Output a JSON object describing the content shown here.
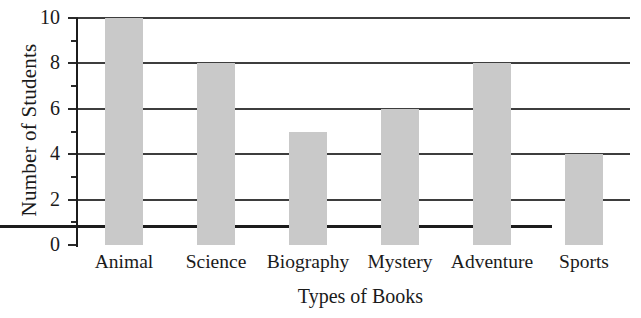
{
  "chart_data": {
    "type": "bar",
    "title": "",
    "subtitle": "",
    "xlabel": "Types of Books",
    "ylabel": "Number of Students",
    "categories": [
      "Animal",
      "Science",
      "Biography",
      "Mystery",
      "Adventure",
      "Sports"
    ],
    "values": [
      10,
      8,
      5,
      6,
      8,
      4
    ],
    "series": [
      {
        "name": "Number of Students",
        "values": [
          10,
          8,
          5,
          6,
          8,
          4
        ]
      }
    ],
    "ylim": [
      0,
      10
    ],
    "xlim": null,
    "y_major_ticks": [
      0,
      2,
      4,
      6,
      8,
      10
    ],
    "y_minor_ticks": [
      1,
      3,
      5,
      7,
      9
    ],
    "ytick_labels": [
      "0",
      "2",
      "4",
      "6",
      "8",
      "10"
    ],
    "grid": "horizontal-major-only",
    "legend": null,
    "legend_position": "none",
    "annotations": [],
    "bar_color": "#c9c9c9",
    "axis_color": "#1c1c1c",
    "gridline_color": "#3d3d3d",
    "background_color": "#ffffff",
    "text_color": "#1a1a1a"
  },
  "axes": {
    "y_title": "Number of Students",
    "x_title": "Types of Books"
  },
  "ytick_labels": [
    {
      "value": 10,
      "text": "10"
    },
    {
      "value": 8,
      "text": "8"
    },
    {
      "value": 6,
      "text": "6"
    },
    {
      "value": 4,
      "text": "4"
    },
    {
      "value": 2,
      "text": "2"
    },
    {
      "value": 0,
      "text": "0"
    }
  ],
  "bars": [
    {
      "label": "Animal",
      "value": 10
    },
    {
      "label": "Science",
      "value": 8
    },
    {
      "label": "Biography",
      "value": 5
    },
    {
      "label": "Mystery",
      "value": 6
    },
    {
      "label": "Adventure",
      "value": 8
    },
    {
      "label": "Sports",
      "value": 4
    }
  ]
}
